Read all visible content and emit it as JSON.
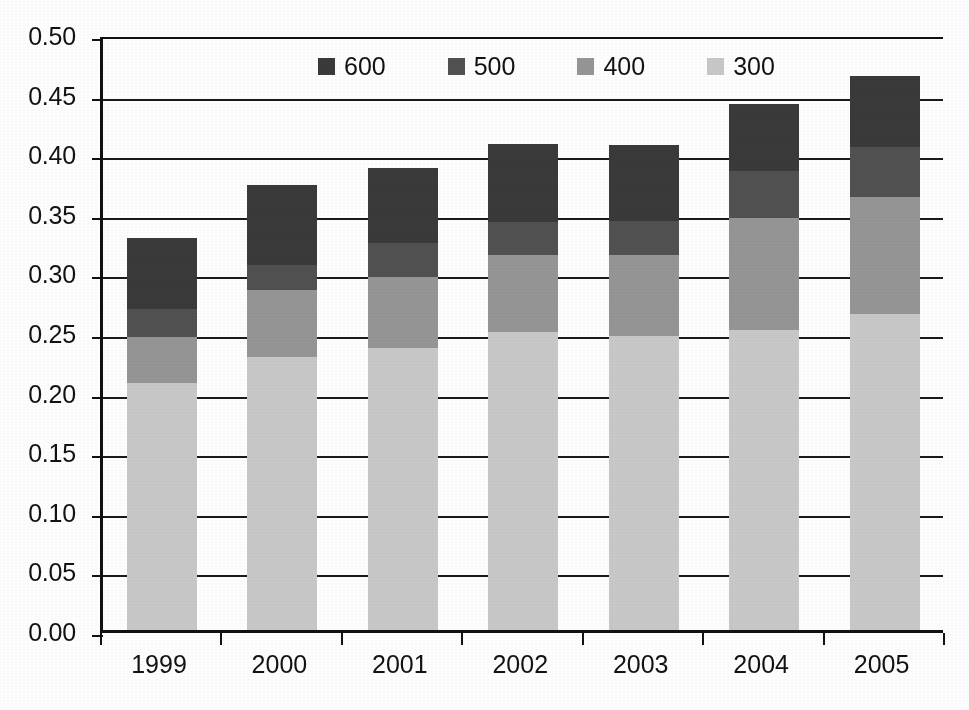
{
  "chart_data": {
    "type": "bar",
    "subtype": "stacked-bar",
    "title": "",
    "xlabel": "",
    "ylabel": "",
    "categories": [
      "1999",
      "2000",
      "2001",
      "2002",
      "2003",
      "2004",
      "2005"
    ],
    "series": [
      {
        "name": "300",
        "color": "#c9c9c9",
        "values": [
          0.207,
          0.229,
          0.237,
          0.25,
          0.247,
          0.252,
          0.265
        ]
      },
      {
        "name": "400",
        "color": "#969696",
        "values": [
          0.039,
          0.056,
          0.059,
          0.065,
          0.068,
          0.094,
          0.098
        ]
      },
      {
        "name": "500",
        "color": "#515151",
        "values": [
          0.023,
          0.021,
          0.029,
          0.027,
          0.028,
          0.039,
          0.042
        ]
      },
      {
        "name": "600",
        "color": "#3a3a3a",
        "values": [
          0.06,
          0.067,
          0.063,
          0.066,
          0.064,
          0.056,
          0.06
        ]
      }
    ],
    "totals": [
      0.329,
      0.373,
      0.388,
      0.408,
      0.407,
      0.441,
      0.465
    ],
    "ylim": [
      0.0,
      0.5
    ],
    "ytick_step": 0.05,
    "ytick_labels": [
      "0.00",
      "0.05",
      "0.10",
      "0.15",
      "0.20",
      "0.25",
      "0.30",
      "0.35",
      "0.40",
      "0.45",
      "0.50"
    ],
    "ytick_values": [
      0.0,
      0.05,
      0.1,
      0.15,
      0.2,
      0.25,
      0.3,
      0.35,
      0.4,
      0.45,
      0.5
    ],
    "grid": true,
    "grid_axis": "y",
    "legend_position": "top-center",
    "legend_order": [
      "600",
      "500",
      "400",
      "300"
    ],
    "stack_order_bottom_to_top": [
      "300",
      "400",
      "500",
      "600"
    ]
  },
  "legend": {
    "entries": [
      {
        "label": "600",
        "color": "#3a3a3a"
      },
      {
        "label": "500",
        "color": "#515151"
      },
      {
        "label": "400",
        "color": "#969696"
      },
      {
        "label": "300",
        "color": "#c9c9c9"
      }
    ]
  },
  "axes": {
    "y_labels": [
      "0.50",
      "0.45",
      "0.40",
      "0.35",
      "0.30",
      "0.25",
      "0.20",
      "0.15",
      "0.10",
      "0.05",
      "0.00"
    ],
    "x_labels": [
      "1999",
      "2000",
      "2001",
      "2002",
      "2003",
      "2004",
      "2005"
    ]
  },
  "style": {
    "axis_color": "#111111",
    "grid_color": "#1a1a1a",
    "background": "#ffffff"
  }
}
